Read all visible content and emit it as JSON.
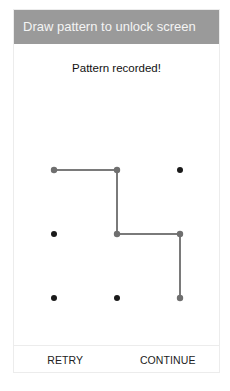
{
  "dialog": {
    "title": "Draw pattern to unlock screen",
    "status": "Pattern recorded!",
    "buttons": {
      "retry": "RETRY",
      "continue": "CONTINUE"
    }
  },
  "pattern": {
    "grid": [
      {
        "id": 1,
        "row": 0,
        "col": 0,
        "selected": true
      },
      {
        "id": 2,
        "row": 0,
        "col": 1,
        "selected": true
      },
      {
        "id": 3,
        "row": 0,
        "col": 2,
        "selected": false
      },
      {
        "id": 4,
        "row": 1,
        "col": 0,
        "selected": false
      },
      {
        "id": 5,
        "row": 1,
        "col": 1,
        "selected": true
      },
      {
        "id": 6,
        "row": 1,
        "col": 2,
        "selected": true
      },
      {
        "id": 7,
        "row": 2,
        "col": 0,
        "selected": false
      },
      {
        "id": 8,
        "row": 2,
        "col": 1,
        "selected": false
      },
      {
        "id": 9,
        "row": 2,
        "col": 2,
        "selected": true
      }
    ],
    "path": [
      1,
      2,
      5,
      6,
      9
    ]
  },
  "colors": {
    "header_bg": "#9a9a9a",
    "line": "#7a7a7a",
    "dot_selected": "#6f6f6f",
    "dot_idle": "#1a1a1a"
  }
}
